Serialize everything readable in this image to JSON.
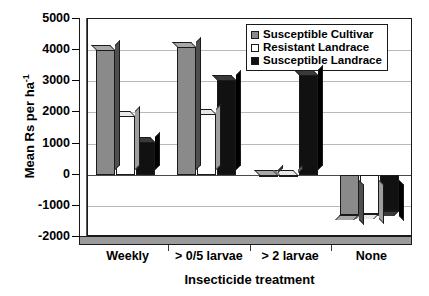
{
  "chart_data": {
    "type": "bar",
    "title": "",
    "xlabel": "Insecticide treatment",
    "ylabel": "Mean Rs per ha-1",
    "ylabel_base": "Mean Rs per ha",
    "ylabel_sup": "-1",
    "categories": [
      "Weekly",
      "> 0/5 larvae",
      "> 2 larvae",
      "None"
    ],
    "series": [
      {
        "name": "Susceptible Cultivar",
        "color": "#8a8a8a",
        "values": [
          4000,
          4100,
          0,
          -1300
        ]
      },
      {
        "name": "Resistant Landrace",
        "color": "#ffffff",
        "values": [
          1900,
          1950,
          0,
          -1250
        ]
      },
      {
        "name": "Susceptible Landrace",
        "color": "#111111",
        "values": [
          1050,
          3050,
          3200,
          -1150
        ]
      }
    ],
    "ylim": [
      -2000,
      5000
    ],
    "ytick_step": 1000,
    "yticks": [
      5000,
      4000,
      3000,
      2000,
      1000,
      0,
      -1000,
      -2000
    ],
    "ytick_labels": [
      "5000",
      "4000",
      "3000",
      "2000",
      "1000",
      "0",
      "-1000",
      "-2000"
    ],
    "grid": true,
    "legend_position": "top-right"
  }
}
